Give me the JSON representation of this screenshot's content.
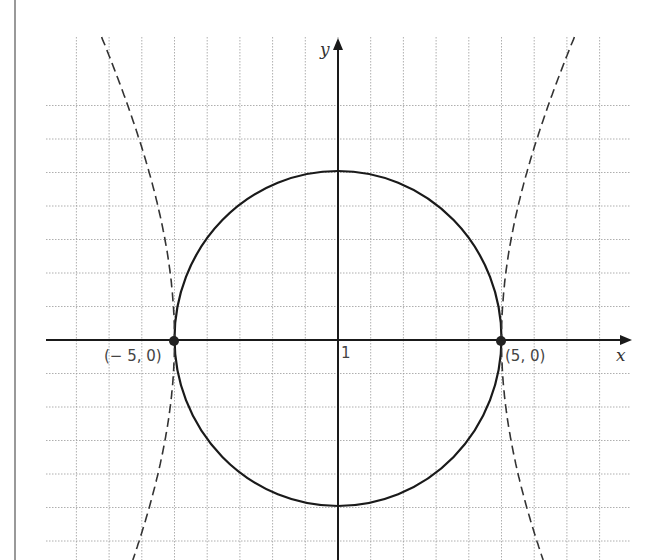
{
  "figure": {
    "type": "coordinate-graph",
    "axes": {
      "x_label": "x",
      "y_label": "y",
      "tick_label": "1",
      "grid_step": 1,
      "x_range": [
        -9,
        9
      ],
      "y_range": [
        -9,
        7
      ]
    },
    "curves": [
      {
        "name": "circle",
        "equation": "x^2 + y^2 = 25",
        "style": "solid",
        "color": "#1a1a1a"
      },
      {
        "name": "hyperbola",
        "equation": "x^2/25 - y^2/75 = 1",
        "style": "dashed",
        "color": "#333333"
      }
    ],
    "points": [
      {
        "label": "(− 5, 0)",
        "x": -5,
        "y": 0
      },
      {
        "label": "(5, 0)",
        "x": 5,
        "y": 0
      }
    ],
    "colors": {
      "grid": "#9a9a9a",
      "axis": "#1a1a1a",
      "label": "#444444"
    }
  }
}
